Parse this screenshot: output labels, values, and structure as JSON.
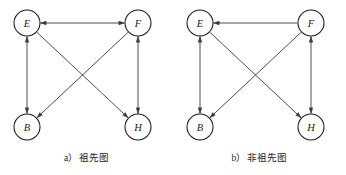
{
  "figure": {
    "panels": [
      {
        "id": "a",
        "caption": "a）祖先图",
        "nodes": [
          {
            "id": "E",
            "label": "E",
            "cx": 27,
            "cy": 23,
            "r": 13
          },
          {
            "id": "F",
            "label": "F",
            "cx": 138,
            "cy": 23,
            "r": 13
          },
          {
            "id": "B",
            "label": "B",
            "cx": 27,
            "cy": 127,
            "r": 13
          },
          {
            "id": "H",
            "label": "H",
            "cx": 138,
            "cy": 127,
            "r": 13
          }
        ],
        "edges": [
          {
            "from": "E",
            "to": "F",
            "kind": "bidirectional",
            "shape": "horizontal"
          },
          {
            "from": "E",
            "to": "B",
            "kind": "bidirectional",
            "shape": "vertical"
          },
          {
            "from": "F",
            "to": "H",
            "kind": "bidirectional",
            "shape": "vertical"
          },
          {
            "from": "F",
            "to": "B",
            "kind": "directed",
            "shape": "diagonal"
          },
          {
            "from": "E",
            "to": "H",
            "kind": "directed",
            "shape": "diagonal"
          }
        ]
      },
      {
        "id": "b",
        "caption": "b）非祖先图",
        "nodes": [
          {
            "id": "E",
            "label": "E",
            "cx": 27,
            "cy": 23,
            "r": 13
          },
          {
            "id": "F",
            "label": "F",
            "cx": 138,
            "cy": 23,
            "r": 13
          },
          {
            "id": "B",
            "label": "B",
            "cx": 27,
            "cy": 127,
            "r": 13
          },
          {
            "id": "H",
            "label": "H",
            "cx": 138,
            "cy": 127,
            "r": 13
          }
        ],
        "edges": [
          {
            "from": "F",
            "to": "E",
            "kind": "directed",
            "shape": "horizontal"
          },
          {
            "from": "E",
            "to": "B",
            "kind": "bidirectional",
            "shape": "vertical"
          },
          {
            "from": "F",
            "to": "H",
            "kind": "bidirectional",
            "shape": "vertical"
          },
          {
            "from": "F",
            "to": "B",
            "kind": "directed",
            "shape": "diagonal"
          },
          {
            "from": "E",
            "to": "H",
            "kind": "directed",
            "shape": "diagonal"
          }
        ]
      }
    ],
    "colors": {
      "node_stroke": "#1a1a1a",
      "node_fill": "#ffffff",
      "edge_stroke": "#3a3a3a",
      "text": "#1a1a1a",
      "background": "#ffffff"
    }
  }
}
